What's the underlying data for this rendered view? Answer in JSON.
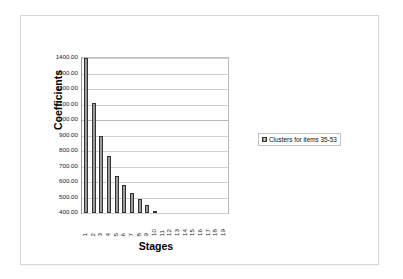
{
  "chart_data": {
    "type": "bar",
    "title": "",
    "xlabel": "Stages",
    "ylabel": "Coefficients",
    "categories": [
      "1",
      "2",
      "3",
      "4",
      "5",
      "6",
      "7",
      "8",
      "9",
      "10",
      "11",
      "12",
      "13",
      "14",
      "15",
      "16",
      "17",
      "18",
      "19"
    ],
    "values": [
      1400.0,
      1110.0,
      895.0,
      765.0,
      640.0,
      580.0,
      530.0,
      490.0,
      452.0,
      415.0,
      402.0,
      400.0,
      400.0,
      400.0,
      400.0,
      400.0,
      400.0,
      400.0,
      400.0
    ],
    "ylim": [
      400,
      1400
    ],
    "ytick_values": [
      1400,
      1300,
      1200,
      1100,
      1000,
      900,
      800,
      700,
      600,
      500,
      400
    ],
    "ytick_labels": [
      "1400.00",
      "1300.00",
      "1200.00",
      "1100.00",
      "1000.00",
      "900.00",
      "800.00",
      "700.00",
      "600.00",
      "500.00",
      "400.00"
    ],
    "grid": true,
    "legend_position": "right",
    "series": [
      {
        "name": "Clusters for items 35-53",
        "values": [
          1400.0,
          1110.0,
          895.0,
          765.0,
          640.0,
          580.0,
          530.0,
          490.0,
          452.0,
          415.0,
          402.0,
          400.0,
          400.0,
          400.0,
          400.0,
          400.0,
          400.0,
          400.0,
          400.0
        ]
      }
    ]
  },
  "legend": {
    "entries": [
      {
        "label": "Clusters for items 35-53",
        "swatch_color": "#a0a0a0"
      }
    ]
  },
  "axes": {
    "y_title": "Coefficients",
    "x_title": "Stages"
  },
  "colors": {
    "bar_fill": "#a8a8a8",
    "bar_border": "#333333",
    "gridline": "#d0d0d0",
    "frame_border": "#d8d8d8",
    "text": "#1a1a1a",
    "background": "#ffffff"
  }
}
